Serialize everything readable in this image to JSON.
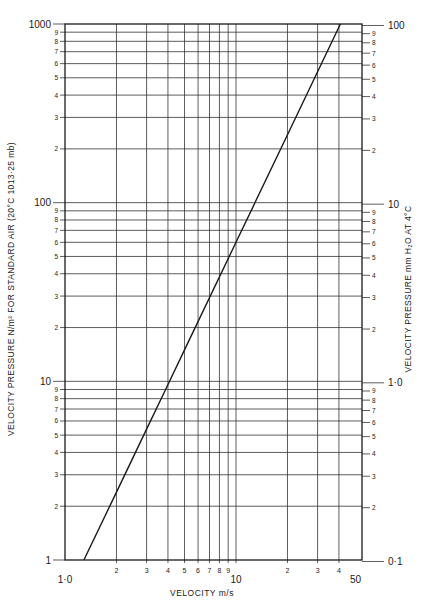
{
  "chart_data": {
    "type": "line",
    "title": "",
    "xlabel": "VELOCITY m/s",
    "ylabel": "VELOCITY PRESSURE N/m² FOR STANDARD AIR (20°C 1013·25 mb)",
    "ylabel_right": "VELOCITY PRESSURE mm H₂O AT 4°C",
    "xscale": "log",
    "yscale": "log",
    "xlim": [
      1.0,
      50
    ],
    "ylim": [
      1,
      1000
    ],
    "ylim_right": [
      0.1,
      100
    ],
    "grid": true,
    "x_ticks": [
      {
        "value": 1,
        "label": "1·0"
      },
      {
        "value": 2,
        "label": "2"
      },
      {
        "value": 3,
        "label": "3"
      },
      {
        "value": 4,
        "label": "4"
      },
      {
        "value": 5,
        "label": "5"
      },
      {
        "value": 6,
        "label": "6"
      },
      {
        "value": 7,
        "label": "7"
      },
      {
        "value": 8,
        "label": "8"
      },
      {
        "value": 9,
        "label": "9"
      },
      {
        "value": 10,
        "label": "10"
      },
      {
        "value": 20,
        "label": "2"
      },
      {
        "value": 30,
        "label": "3"
      },
      {
        "value": 40,
        "label": "4"
      },
      {
        "value": 50,
        "label": "50"
      }
    ],
    "y_ticks_left": [
      {
        "value": 1,
        "label": "1"
      },
      {
        "value": 2,
        "label": "2"
      },
      {
        "value": 3,
        "label": "3"
      },
      {
        "value": 4,
        "label": "4"
      },
      {
        "value": 5,
        "label": "5"
      },
      {
        "value": 6,
        "label": "6"
      },
      {
        "value": 7,
        "label": "7"
      },
      {
        "value": 8,
        "label": "8"
      },
      {
        "value": 9,
        "label": "9"
      },
      {
        "value": 10,
        "label": "10"
      },
      {
        "value": 20,
        "label": "2"
      },
      {
        "value": 30,
        "label": "3"
      },
      {
        "value": 40,
        "label": "4"
      },
      {
        "value": 50,
        "label": "5"
      },
      {
        "value": 60,
        "label": "6"
      },
      {
        "value": 70,
        "label": "7"
      },
      {
        "value": 80,
        "label": "8"
      },
      {
        "value": 90,
        "label": "9"
      },
      {
        "value": 100,
        "label": "100"
      },
      {
        "value": 200,
        "label": "2"
      },
      {
        "value": 300,
        "label": "3"
      },
      {
        "value": 400,
        "label": "4"
      },
      {
        "value": 500,
        "label": "5"
      },
      {
        "value": 600,
        "label": "6"
      },
      {
        "value": 700,
        "label": "7"
      },
      {
        "value": 800,
        "label": "8"
      },
      {
        "value": 900,
        "label": "9"
      },
      {
        "value": 1000,
        "label": "1000"
      }
    ],
    "y_ticks_right": [
      {
        "value": 0.1,
        "label": "0·1"
      },
      {
        "value": 0.2,
        "label": "2"
      },
      {
        "value": 0.3,
        "label": "3"
      },
      {
        "value": 0.4,
        "label": "4"
      },
      {
        "value": 0.5,
        "label": "5"
      },
      {
        "value": 0.6,
        "label": "6"
      },
      {
        "value": 0.7,
        "label": "7"
      },
      {
        "value": 0.8,
        "label": "8"
      },
      {
        "value": 0.9,
        "label": "9"
      },
      {
        "value": 1.0,
        "label": "1·0"
      },
      {
        "value": 2,
        "label": "2"
      },
      {
        "value": 3,
        "label": "3"
      },
      {
        "value": 4,
        "label": "4"
      },
      {
        "value": 5,
        "label": "5"
      },
      {
        "value": 6,
        "label": "6"
      },
      {
        "value": 7,
        "label": "7"
      },
      {
        "value": 8,
        "label": "8"
      },
      {
        "value": 9,
        "label": "9"
      },
      {
        "value": 10,
        "label": "10"
      },
      {
        "value": 20,
        "label": "2"
      },
      {
        "value": 30,
        "label": "3"
      },
      {
        "value": 40,
        "label": "4"
      },
      {
        "value": 50,
        "label": "5"
      },
      {
        "value": 60,
        "label": "6"
      },
      {
        "value": 70,
        "label": "7"
      },
      {
        "value": 80,
        "label": "8"
      },
      {
        "value": 90,
        "label": "9"
      },
      {
        "value": 100,
        "label": "100"
      }
    ],
    "series": [
      {
        "name": "Velocity pressure (standard air)",
        "x": [
          1.29,
          2,
          3,
          4,
          5,
          10,
          20,
          30,
          40.8
        ],
        "y": [
          1,
          2.4,
          5.4,
          9.6,
          15,
          60,
          240,
          540,
          1000
        ]
      }
    ]
  },
  "labels": {
    "xlabel": "VELOCITY   m/s",
    "ylabel_left": "VELOCITY  PRESSURE  N/m²  FOR  STANDARD  AIR  (20°C  1013·25 mb)",
    "ylabel_right": "VELOCITY  PRESSURE  mm  H₂O  AT  4°C"
  }
}
